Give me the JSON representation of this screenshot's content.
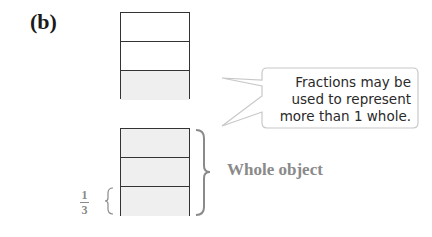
{
  "figure": {
    "label": "(b)",
    "top_bar": {
      "parts": 3,
      "shaded_parts": [
        3
      ]
    },
    "bottom_bar": {
      "parts": 3,
      "shaded_parts": [
        1,
        2,
        3
      ]
    },
    "callout_lines": [
      "Fractions may be",
      "used to represent",
      "more than 1 whole."
    ],
    "brace_label": "Whole object",
    "fraction": {
      "numerator": "1",
      "denominator": "3"
    },
    "colors": {
      "shade": "#efefef",
      "outline": "#333333",
      "annotation": "#8a8a8a"
    }
  }
}
